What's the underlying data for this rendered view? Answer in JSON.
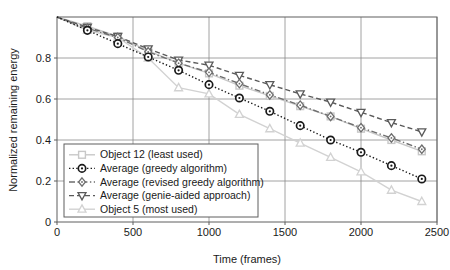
{
  "chart_data": {
    "type": "line",
    "title": "",
    "xlabel": "Time (frames)",
    "ylabel": "Normalized remaining energy",
    "xlim": [
      0,
      2500
    ],
    "ylim": [
      0,
      1.0
    ],
    "xticks": [
      0,
      500,
      1000,
      1500,
      2000,
      2500
    ],
    "xticklabels": [
      "0",
      "500",
      "1000",
      "1500",
      "2000",
      "2500"
    ],
    "yticks": [
      0,
      0.2,
      0.4,
      0.6,
      0.8
    ],
    "yticklabels": [
      "0",
      "0.2",
      "0.4",
      "0.6",
      "0.8"
    ],
    "grid": true,
    "legend_position": "lower left",
    "x": [
      0,
      200,
      400,
      600,
      800,
      1000,
      1200,
      1400,
      1600,
      1800,
      2000,
      2200,
      2400
    ],
    "series": [
      {
        "name": "Object 12 (least used)",
        "marker": "square",
        "linestyle": "solid",
        "color": "#c8c8c8",
        "values": [
          1.0,
          0.955,
          0.905,
          0.835,
          0.775,
          0.725,
          0.665,
          0.615,
          0.565,
          0.515,
          0.455,
          0.4,
          0.345
        ]
      },
      {
        "name": "Average (greedy algorithm)",
        "marker": "circle",
        "linestyle": "dotted",
        "color": "#1a1a1a",
        "values": [
          1.0,
          0.935,
          0.87,
          0.805,
          0.74,
          0.67,
          0.605,
          0.54,
          0.47,
          0.4,
          0.34,
          0.275,
          0.21
        ]
      },
      {
        "name": "Average (revised greedy algorithm)",
        "marker": "diamond",
        "linestyle": "dashdot",
        "color": "#6e6e6e",
        "values": [
          1.0,
          0.945,
          0.9,
          0.83,
          0.775,
          0.73,
          0.675,
          0.62,
          0.57,
          0.515,
          0.46,
          0.41,
          0.355
        ]
      },
      {
        "name": "Average (genie-aided approach)",
        "marker": "triangle-down",
        "linestyle": "dashed",
        "color": "#5a5a5a",
        "values": [
          1.0,
          0.95,
          0.905,
          0.845,
          0.79,
          0.765,
          0.715,
          0.67,
          0.625,
          0.585,
          0.535,
          0.485,
          0.44
        ]
      },
      {
        "name": "Object 5 (most used)",
        "marker": "triangle-up",
        "linestyle": "solid",
        "color": "#d2d2d2",
        "values": [
          1.0,
          0.935,
          0.9,
          0.8,
          0.655,
          0.625,
          0.525,
          0.455,
          0.385,
          0.315,
          0.245,
          0.155,
          0.1
        ]
      }
    ]
  },
  "legend": {
    "items": [
      {
        "label": "Object 12 (least used)"
      },
      {
        "label": "Average (greedy algorithm)"
      },
      {
        "label": "Average (revised greedy algorithm)"
      },
      {
        "label": "Average (genie-aided approach)"
      },
      {
        "label": "Object 5 (most used)"
      }
    ]
  },
  "colors": {
    "axis": "#5f5f5f",
    "grid": "#8a8a8a",
    "text": "#1a1a1a",
    "background": "#ffffff"
  }
}
